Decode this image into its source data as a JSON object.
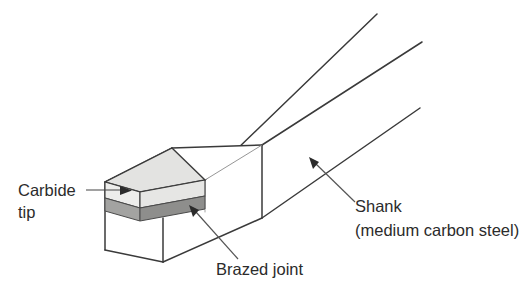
{
  "figure": {
    "title": "Brazed carbide-tipped single-point cutting tool (isometric cutaway)",
    "background_color": "#ffffff",
    "line_color": "#3a3a3a",
    "leader_color": "#555555"
  },
  "materials": {
    "carbide_top_face": "#e3e3e1",
    "carbide_front_face": "#ededeb",
    "carbide_right_face": "#d8d8d6",
    "brazed_joint_front": "#a3a3a1",
    "brazed_joint_right": "#8e8e8c",
    "shank_face": "#ffffff"
  },
  "labels": {
    "carbide": {
      "line1": "Carbide",
      "line2": "tip",
      "leader": "horizontal-arrow-right"
    },
    "brazed": {
      "line1": "Brazed joint",
      "leader": "diagonal-arrow-up-left"
    },
    "shank": {
      "line1": "Shank",
      "line2": "(medium carbon steel)",
      "leader": "diagonal-arrow-up-left"
    }
  }
}
